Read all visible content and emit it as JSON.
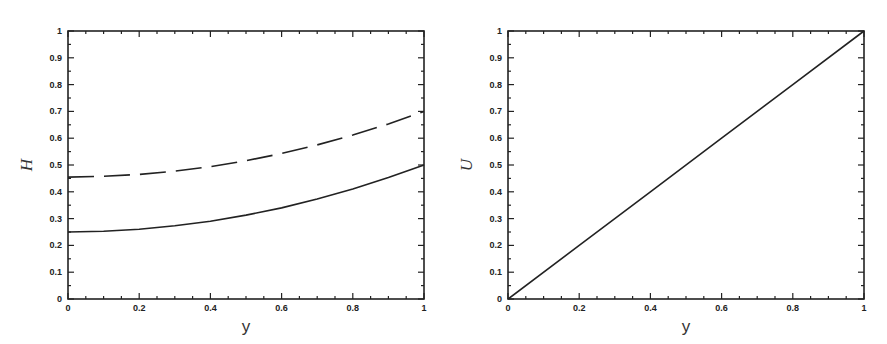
{
  "chart_data": [
    {
      "type": "line",
      "title": "",
      "xlabel": "y",
      "ylabel": "H",
      "xlim": [
        0,
        1
      ],
      "ylim": [
        0,
        1
      ],
      "grid": false,
      "legend": null,
      "xticks": [
        "0",
        "0.2",
        "0.4",
        "0.6",
        "0.8",
        "1"
      ],
      "yticks": [
        "0",
        "0.1",
        "0.2",
        "0.3",
        "0.4",
        "0.5",
        "0.6",
        "0.7",
        "0.8",
        "0.9",
        "1"
      ],
      "x": [
        0,
        0.1,
        0.2,
        0.3,
        0.4,
        0.5,
        0.6,
        0.7,
        0.8,
        0.9,
        1.0
      ],
      "series": [
        {
          "name": "dashed",
          "style": "dashed",
          "color": "#222222",
          "values": [
            0.455,
            0.458,
            0.465,
            0.477,
            0.494,
            0.516,
            0.543,
            0.575,
            0.612,
            0.653,
            0.7
          ]
        },
        {
          "name": "solid",
          "style": "solid",
          "color": "#222222",
          "values": [
            0.25,
            0.253,
            0.26,
            0.273,
            0.29,
            0.313,
            0.34,
            0.373,
            0.41,
            0.453,
            0.5
          ]
        }
      ]
    },
    {
      "type": "line",
      "title": "",
      "xlabel": "y",
      "ylabel": "U",
      "xlim": [
        0,
        1
      ],
      "ylim": [
        0,
        1
      ],
      "grid": false,
      "legend": null,
      "xticks": [
        "0",
        "0.2",
        "0.4",
        "0.6",
        "0.8",
        "1"
      ],
      "yticks": [
        "0",
        "0.1",
        "0.2",
        "0.3",
        "0.4",
        "0.5",
        "0.6",
        "0.7",
        "0.8",
        "0.9",
        "1"
      ],
      "x": [
        0,
        0.2,
        0.4,
        0.6,
        0.8,
        1.0
      ],
      "series": [
        {
          "name": "solid",
          "style": "solid",
          "color": "#222222",
          "values": [
            0,
            0.2,
            0.4,
            0.6,
            0.8,
            1.0
          ]
        }
      ]
    }
  ]
}
